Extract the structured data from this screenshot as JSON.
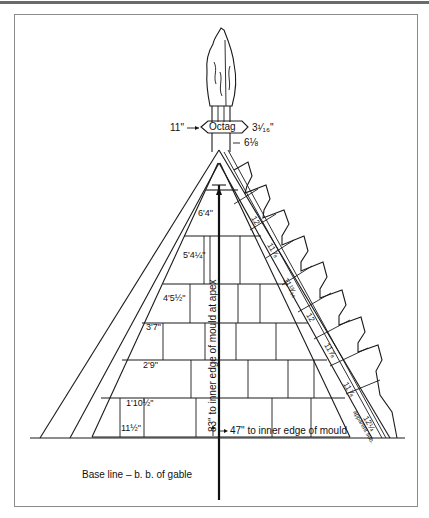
{
  "figure": {
    "type": "gable stonework setting-out drawing",
    "finial": {
      "octagon_label": "Octag",
      "left_dim": "11\"",
      "right_dim": "3¹⁄₁₆\"",
      "lower_dim": "6⅛"
    },
    "course_heights": [
      {
        "label": "6'4\""
      },
      {
        "label": "5'4¼\""
      },
      {
        "label": "4'5½\""
      },
      {
        "label": "3'7\""
      },
      {
        "label": "2'9\""
      },
      {
        "label": "1'10½\""
      },
      {
        "label": "11½\""
      }
    ],
    "coping_units": [
      {
        "label": "12"
      },
      {
        "label": "11⅞"
      },
      {
        "label": "11¹³⁄₁₆"
      },
      {
        "label": "12"
      },
      {
        "label": "11⅞"
      },
      {
        "label": "11⅞"
      },
      {
        "label": "12¼"
      }
    ],
    "coping_note": "apparent sub.",
    "vertical_dim": "83\" to inner edge of mould at apex",
    "horizontal_dim": "47\" to inner edge of mould",
    "baseline_label": "Base line – b. b. of gable"
  }
}
